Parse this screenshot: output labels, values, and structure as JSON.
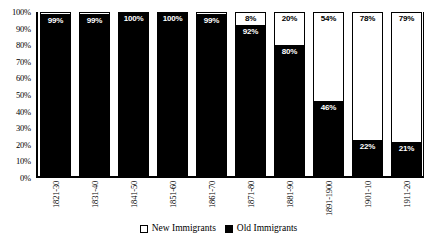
{
  "chart_data": {
    "type": "bar",
    "subtype": "100% stacked bar",
    "title": "",
    "xlabel": "",
    "ylabel": "",
    "ylim": [
      0,
      100
    ],
    "yticks": [
      "0%",
      "10%",
      "20%",
      "30%",
      "40%",
      "50%",
      "60%",
      "70%",
      "80%",
      "90%",
      "100%"
    ],
    "grid": false,
    "legend_position": "bottom-center",
    "categories": [
      "1821-30",
      "1831-40",
      "1841-50",
      "1851-60",
      "1861-70",
      "1871-80",
      "1881-90",
      "1891-1900",
      "1901-10",
      "1911-20"
    ],
    "series": [
      {
        "name": "New Immigrants",
        "color": "#ffffff",
        "values": [
          1,
          1,
          0,
          0,
          1,
          8,
          20,
          54,
          78,
          79
        ],
        "labels": [
          "",
          "",
          "",
          "",
          "",
          "8%",
          "20%",
          "54%",
          "78%",
          "79%"
        ]
      },
      {
        "name": "Old Immigrants",
        "color": "#000000",
        "values": [
          99,
          99,
          100,
          100,
          99,
          92,
          80,
          46,
          22,
          21
        ],
        "labels": [
          "99%",
          "99%",
          "100%",
          "100%",
          "99%",
          "92%",
          "80%",
          "46%",
          "22%",
          "21%"
        ]
      }
    ]
  },
  "legend": {
    "items": [
      {
        "label": "New Immigrants",
        "swatch": "white-square-icon"
      },
      {
        "label": "Old Immigrants",
        "swatch": "black-square-icon"
      }
    ]
  }
}
